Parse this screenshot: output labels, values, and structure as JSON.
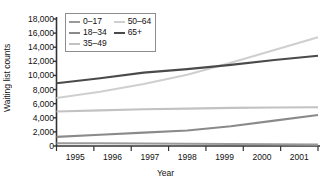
{
  "chart_data": {
    "type": "line",
    "title": "",
    "xlabel": "Year",
    "ylabel": "Waiting list counts",
    "x": [
      1995,
      1996,
      1997,
      1998,
      1999,
      2000,
      2001
    ],
    "xtick_labels": [
      "1995",
      "1996",
      "1997",
      "1998",
      "1999",
      "2000",
      "2001"
    ],
    "ytick_labels": [
      "0",
      "2,000",
      "4,000",
      "6,000",
      "8,000",
      "10,000",
      "12,000",
      "14,000",
      "16,000",
      "18,000"
    ],
    "ytick_values": [
      0,
      2000,
      4000,
      6000,
      8000,
      10000,
      12000,
      14000,
      16000,
      18000
    ],
    "ylim": [
      0,
      18000
    ],
    "xlim": [
      1995,
      2001
    ],
    "grid": false,
    "legend_position": "upper-left-inside",
    "series": [
      {
        "name": "0–17",
        "color": "#9a9a9a",
        "values": [
          400,
          380,
          350,
          320,
          290,
          250,
          200
        ]
      },
      {
        "name": "18–34",
        "color": "#8a8a8a",
        "values": [
          1300,
          1600,
          1900,
          2200,
          2800,
          3600,
          4400
        ]
      },
      {
        "name": "35–49",
        "color": "#c2c2c2",
        "values": [
          4900,
          5050,
          5200,
          5300,
          5400,
          5450,
          5500
        ]
      },
      {
        "name": "50–64",
        "color": "#cfcfcf",
        "values": [
          6800,
          7700,
          8800,
          10100,
          11800,
          13600,
          15400
        ]
      },
      {
        "name": "65+",
        "color": "#4a4a4a",
        "values": [
          8900,
          9600,
          10400,
          10900,
          11500,
          12200,
          12800
        ]
      }
    ],
    "axis_color": "#333333",
    "legend_border_color": "#8d8d8d",
    "background_color": "#ffffff"
  }
}
